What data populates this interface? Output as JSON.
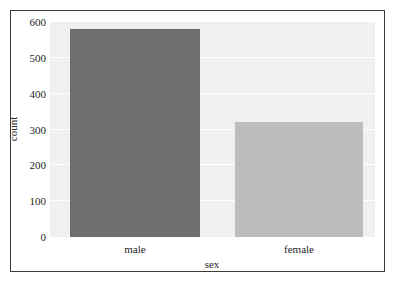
{
  "chart_data": {
    "type": "bar",
    "title": "",
    "subtitle": "",
    "categories": [
      "male",
      "female"
    ],
    "values": [
      580,
      320
    ],
    "xlabel": "sex",
    "ylabel": "count",
    "ylim": [
      0,
      600
    ],
    "yticks": [
      0,
      100,
      200,
      300,
      400,
      500,
      600
    ],
    "ytick_labels": [
      "0",
      "100",
      "200",
      "300",
      "400",
      "500",
      "600"
    ],
    "xtick_labels": [
      "male",
      "female"
    ],
    "grid": "horizontal",
    "legend": "none",
    "annotations": [],
    "bar_colors": [
      "#6e6e6e",
      "#bdbdbd"
    ],
    "plot_background": "#f0f0f0",
    "gridline_color": "#ffffff",
    "frame_color": "#3c3c3c",
    "text_color": "#262626"
  }
}
